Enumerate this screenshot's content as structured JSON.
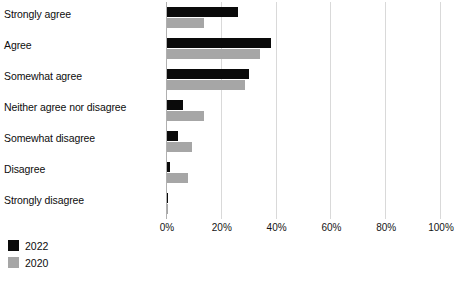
{
  "chart_data": {
    "type": "bar",
    "orientation": "horizontal",
    "grouped": true,
    "title": "",
    "subtitle": "",
    "xlabel": "",
    "ylabel": "",
    "xlim": [
      0,
      100
    ],
    "xticks": [
      0,
      20,
      40,
      60,
      80,
      100
    ],
    "xtick_labels": [
      "0%",
      "20%",
      "40%",
      "60%",
      "80%",
      "100%"
    ],
    "grid": "vertical",
    "legend_position": "bottom-left",
    "categories": [
      "Strongly agree",
      "Agree",
      "Somewhat agree",
      "Neither agree nor disagree",
      "Somewhat disagree",
      "Disagree",
      "Strongly disagree"
    ],
    "series": [
      {
        "name": "2022",
        "color": "#0a0a0a",
        "values": [
          26,
          38,
          30,
          6,
          4,
          1,
          0.5
        ]
      },
      {
        "name": "2020",
        "color": "#a6a6a6",
        "values": [
          13.5,
          34,
          28.5,
          13.5,
          9,
          7.5,
          0.5
        ]
      }
    ]
  },
  "legend": {
    "items": [
      {
        "label": "2022",
        "color": "#0a0a0a"
      },
      {
        "label": "2020",
        "color": "#a6a6a6"
      }
    ]
  }
}
